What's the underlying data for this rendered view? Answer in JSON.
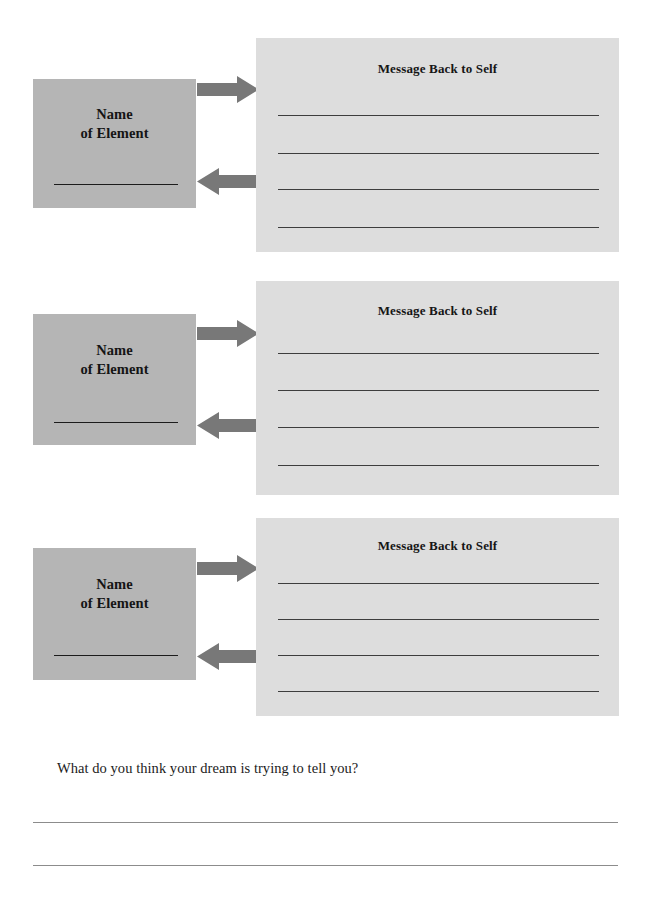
{
  "worksheet": {
    "blocks": [
      {
        "name_card": {
          "line1": "Name",
          "line2": "of Element",
          "fill_in_line": ""
        },
        "message_card": {
          "title": "Message Back to Self",
          "write_lines": [
            "",
            "",
            "",
            ""
          ]
        },
        "arrows": {
          "outgoing": "arrow-right",
          "incoming": "arrow-left"
        }
      },
      {
        "name_card": {
          "line1": "Name",
          "line2": "of Element",
          "fill_in_line": ""
        },
        "message_card": {
          "title": "Message Back to Self",
          "write_lines": [
            "",
            "",
            "",
            ""
          ]
        },
        "arrows": {
          "outgoing": "arrow-right",
          "incoming": "arrow-left"
        }
      },
      {
        "name_card": {
          "line1": "Name",
          "line2": "of Element",
          "fill_in_line": ""
        },
        "message_card": {
          "title": "Message Back to Self",
          "write_lines": [
            "",
            "",
            "",
            ""
          ]
        },
        "arrows": {
          "outgoing": "arrow-right",
          "incoming": "arrow-left"
        }
      }
    ],
    "reflection": {
      "question": "What do you think your dream is trying to tell you?",
      "answer_lines": [
        "",
        ""
      ]
    }
  },
  "colors": {
    "page_background": "#ffffff",
    "name_card_fill": "#b5b5b5",
    "message_card_fill": "#dddddd",
    "arrow_fill": "#787878",
    "rule_line": "#3d3d3d",
    "answer_rule_line": "#8c8c8c",
    "text": "#1b1b1b"
  }
}
